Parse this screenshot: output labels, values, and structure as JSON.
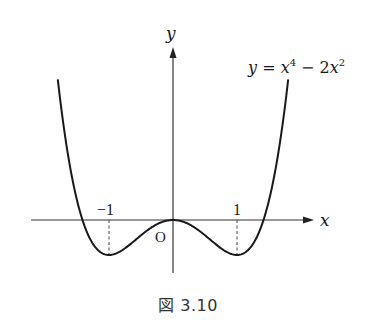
{
  "figure": {
    "caption": "図 3.10",
    "equation_label": "y = x⁴ − 2x²",
    "x_axis_label": "x",
    "y_axis_label": "y",
    "origin_label": "O",
    "tick_labels": {
      "neg_one": "−1",
      "pos_one": "1"
    }
  },
  "chart_data": {
    "type": "line",
    "xlabel": "x",
    "ylabel": "y",
    "function": "x^4 - 2x^2",
    "x_range": [
      -1.8,
      1.8
    ],
    "marked_points": [
      {
        "label": "-1",
        "x": -1,
        "y": -1,
        "note": "local minimum, dashed drop line"
      },
      {
        "label": "1",
        "x": 1,
        "y": -1,
        "note": "local minimum, dashed drop line"
      },
      {
        "label": "O",
        "x": 0,
        "y": 0,
        "note": "origin, local maximum"
      }
    ],
    "roots": [
      -1.414,
      0,
      1.414
    ],
    "series": [
      {
        "name": "y = x^4 - 2x^2",
        "x": [
          -1.8,
          -1.6,
          -1.414,
          -1.2,
          -1.0,
          -0.8,
          -0.6,
          -0.4,
          -0.2,
          0,
          0.2,
          0.4,
          0.6,
          0.8,
          1.0,
          1.2,
          1.414,
          1.6,
          1.8
        ],
        "values": [
          4.02,
          1.43,
          0,
          -0.81,
          -1,
          -0.87,
          -0.59,
          -0.29,
          -0.08,
          0,
          -0.08,
          -0.29,
          -0.59,
          -0.87,
          -1,
          -0.81,
          0,
          1.43,
          4.02
        ]
      }
    ],
    "grid": false,
    "legend": "none"
  }
}
